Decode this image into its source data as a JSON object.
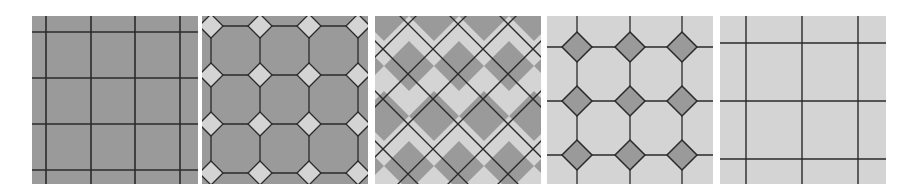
{
  "figure": {
    "colors": {
      "dark_tile": "#9a9a9a",
      "light_tile": "#d4d4d4",
      "grout": "#2a2a2a",
      "background": "#ffffff"
    },
    "panels": [
      {
        "id": "panel-1",
        "pattern": "square-grid-dark",
        "label": ""
      },
      {
        "id": "panel-2",
        "pattern": "octagon-with-light-dots",
        "label": ""
      },
      {
        "id": "panel-3",
        "pattern": "diagonal-checkerboard",
        "label": ""
      },
      {
        "id": "panel-4",
        "pattern": "octagon-light-with-dark-dots",
        "label": ""
      },
      {
        "id": "panel-5",
        "pattern": "square-grid-light",
        "label": ""
      }
    ]
  }
}
